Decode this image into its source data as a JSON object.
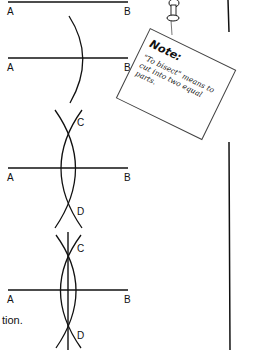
{
  "figures": [
    {
      "step": 1,
      "labels": {
        "left": "A",
        "right": "B"
      }
    },
    {
      "step": 2,
      "labels": {
        "left": "A",
        "right": "B"
      }
    },
    {
      "step": 3,
      "labels": {
        "left": "A",
        "right": "B",
        "top": "C",
        "bottom": "D"
      }
    },
    {
      "step": 4,
      "labels": {
        "left": "A",
        "right": "B",
        "top": "C",
        "bottom": "D"
      }
    }
  ],
  "text_fragment": "tion.",
  "note": {
    "title": "Note:",
    "body": "\"To bisect\" means to cut into two equal parts."
  },
  "colors": {
    "ink": "#111111",
    "paper": "#ffffff"
  }
}
